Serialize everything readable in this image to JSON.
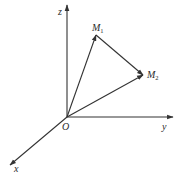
{
  "diagram": {
    "type": "3d-coordinate-vectors",
    "colors": {
      "stroke": "#333333",
      "text": "#2a2a2a",
      "background": "#ffffff"
    },
    "origin": {
      "label": "O",
      "x": 67,
      "y": 117
    },
    "axes": [
      {
        "name": "z",
        "label": "z",
        "from": [
          67,
          117
        ],
        "to": [
          67,
          5
        ]
      },
      {
        "name": "y",
        "label": "y",
        "from": [
          67,
          117
        ],
        "to": [
          173,
          117
        ]
      },
      {
        "name": "x",
        "label": "x",
        "from": [
          67,
          117
        ],
        "to": [
          10,
          165
        ]
      }
    ],
    "points": [
      {
        "name": "M1",
        "label": "M",
        "subscript": "1",
        "x": 96,
        "y": 35
      },
      {
        "name": "M2",
        "label": "M",
        "subscript": "2",
        "x": 143,
        "y": 75
      }
    ],
    "vectors": [
      {
        "from": "O",
        "to": "M1"
      },
      {
        "from": "O",
        "to": "M2"
      },
      {
        "from": "M1",
        "to": "M2"
      }
    ]
  }
}
